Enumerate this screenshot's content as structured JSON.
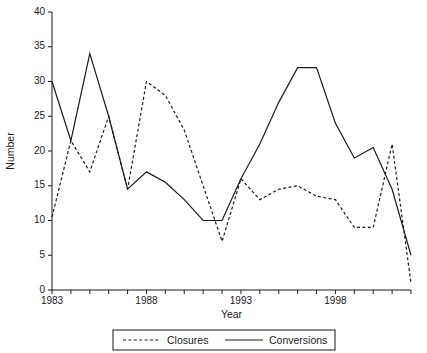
{
  "chart_data": {
    "type": "line",
    "title": "",
    "xlabel": "Year",
    "ylabel": "Number",
    "xlim": [
      1983,
      2002
    ],
    "ylim": [
      0,
      40
    ],
    "yticks": [
      0,
      5,
      10,
      15,
      20,
      25,
      30,
      35,
      40
    ],
    "xticks_major": [
      1983,
      1988,
      1993,
      1998
    ],
    "xticks_minor_step": 1,
    "grid": false,
    "legend_position": "below-axes",
    "x": [
      1983,
      1984,
      1985,
      1986,
      1987,
      1988,
      1989,
      1990,
      1991,
      1992,
      1993,
      1994,
      1995,
      1996,
      1997,
      1998,
      1999,
      2000,
      2001,
      2002
    ],
    "series": [
      {
        "name": "Closures",
        "style": "dashed",
        "color": "#1a1a1a",
        "values": [
          10.5,
          21.5,
          17,
          25,
          14.5,
          30,
          28,
          23,
          15,
          7,
          16,
          13,
          14.5,
          15,
          13.5,
          13,
          9,
          9,
          21,
          1
        ]
      },
      {
        "name": "Conversions",
        "style": "solid",
        "color": "#1a1a1a",
        "values": [
          30,
          21.5,
          34,
          25,
          14.5,
          17,
          15.5,
          13,
          10,
          10,
          16,
          21,
          27,
          32,
          32,
          24,
          19,
          20.5,
          14.5,
          5
        ]
      }
    ]
  },
  "legend": {
    "items": [
      {
        "label": "Closures",
        "style": "dashed"
      },
      {
        "label": "Conversions",
        "style": "solid"
      }
    ]
  },
  "axes": {
    "y_title": "Number",
    "x_title": "Year"
  }
}
